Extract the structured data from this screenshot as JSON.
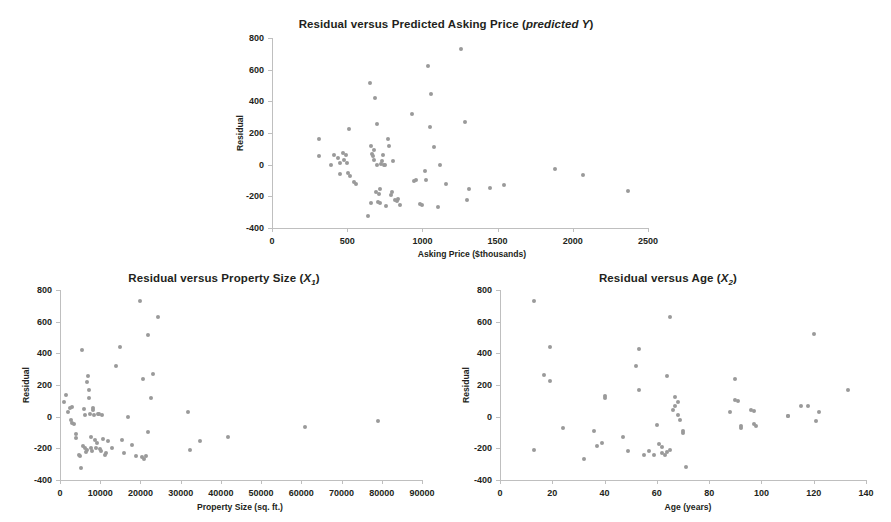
{
  "figure": {
    "background": "#ffffff",
    "point_color": "#9a9a9a",
    "axis_color": "#bfbfbf",
    "text_color": "#231f20"
  },
  "charts": {
    "top": {
      "title_prefix": "Residual versus Predicted Asking Price (",
      "title_italic": "predicted Y",
      "title_suffix": ")",
      "xlabel": "Asking Price ($thousands)",
      "ylabel": "Residual",
      "xticks": [
        "0",
        "500",
        "1000",
        "1500",
        "2000",
        "2500"
      ],
      "yticks": [
        "800",
        "600",
        "400",
        "200",
        "0",
        "-200",
        "-400"
      ]
    },
    "left": {
      "title_prefix": "Residual versus Property Size (",
      "title_var": "X",
      "title_sub": "1",
      "title_suffix": ")",
      "xlabel": "Property Size (sq. ft.)",
      "ylabel": "Residual",
      "xticks": [
        "0",
        "10000",
        "20000",
        "30000",
        "40000",
        "50000",
        "60000",
        "70000",
        "80000",
        "90000"
      ],
      "yticks": [
        "800",
        "600",
        "400",
        "200",
        "0",
        "-200",
        "-400"
      ]
    },
    "right": {
      "title_prefix": "Residual versus Age (",
      "title_var": "X",
      "title_sub": "2",
      "title_suffix": ")",
      "xlabel": "Age (years)",
      "ylabel": "Residual",
      "xticks": [
        "0",
        "20",
        "40",
        "60",
        "80",
        "100",
        "120",
        "140"
      ],
      "yticks": [
        "800",
        "600",
        "400",
        "200",
        "0",
        "-200",
        "-400"
      ]
    }
  },
  "chart_data": [
    {
      "id": "top",
      "type": "scatter",
      "title": "Residual versus Predicted Asking Price (predicted Y)",
      "xlabel": "Asking Price ($thousands)",
      "ylabel": "Residual",
      "xlim": [
        0,
        2500
      ],
      "ylim": [
        -400,
        800
      ],
      "xticks": [
        0,
        500,
        1000,
        1500,
        2000,
        2500
      ],
      "yticks": [
        -400,
        -200,
        0,
        200,
        400,
        600,
        800
      ],
      "grid": false,
      "legend": null,
      "points": [
        [
          310,
          160
        ],
        [
          315,
          55
        ],
        [
          390,
          0
        ],
        [
          415,
          60
        ],
        [
          440,
          45
        ],
        [
          450,
          10
        ],
        [
          455,
          -60
        ],
        [
          470,
          75
        ],
        [
          480,
          30
        ],
        [
          490,
          62
        ],
        [
          500,
          10
        ],
        [
          505,
          -55
        ],
        [
          515,
          225
        ],
        [
          520,
          -70
        ],
        [
          545,
          -110
        ],
        [
          560,
          -120
        ],
        [
          640,
          -325
        ],
        [
          650,
          515
        ],
        [
          655,
          -240
        ],
        [
          660,
          115
        ],
        [
          665,
          70
        ],
        [
          670,
          55
        ],
        [
          675,
          90
        ],
        [
          680,
          30
        ],
        [
          685,
          422
        ],
        [
          690,
          -170
        ],
        [
          695,
          0
        ],
        [
          700,
          255
        ],
        [
          705,
          -235
        ],
        [
          710,
          -185
        ],
        [
          715,
          -155
        ],
        [
          720,
          -245
        ],
        [
          725,
          5
        ],
        [
          730,
          25
        ],
        [
          740,
          60
        ],
        [
          745,
          0
        ],
        [
          750,
          -2
        ],
        [
          755,
          -260
        ],
        [
          770,
          165
        ],
        [
          780,
          120
        ],
        [
          790,
          -190
        ],
        [
          800,
          -175
        ],
        [
          805,
          25
        ],
        [
          820,
          -225
        ],
        [
          830,
          -230
        ],
        [
          840,
          -215
        ],
        [
          850,
          -255
        ],
        [
          930,
          320
        ],
        [
          945,
          -105
        ],
        [
          960,
          -95
        ],
        [
          985,
          -250
        ],
        [
          1000,
          -255
        ],
        [
          1015,
          -40
        ],
        [
          1025,
          -95
        ],
        [
          1040,
          625
        ],
        [
          1050,
          235
        ],
        [
          1060,
          445
        ],
        [
          1075,
          110
        ],
        [
          1105,
          -270
        ],
        [
          1120,
          0
        ],
        [
          1160,
          -120
        ],
        [
          1255,
          730
        ],
        [
          1280,
          270
        ],
        [
          1295,
          -220
        ],
        [
          1310,
          -155
        ],
        [
          1450,
          -150
        ],
        [
          1545,
          -130
        ],
        [
          1880,
          -28
        ],
        [
          2070,
          -68
        ],
        [
          2370,
          -165
        ]
      ]
    },
    {
      "id": "left",
      "type": "scatter",
      "title": "Residual versus Property Size (X1)",
      "xlabel": "Property Size (sq. ft.)",
      "ylabel": "Residual",
      "xlim": [
        0,
        90000
      ],
      "ylim": [
        -400,
        800
      ],
      "xticks": [
        0,
        10000,
        20000,
        30000,
        40000,
        50000,
        60000,
        70000,
        80000,
        90000
      ],
      "yticks": [
        -400,
        -200,
        0,
        200,
        400,
        600,
        800
      ],
      "grid": false,
      "legend": null,
      "points": [
        [
          900,
          95
        ],
        [
          1400,
          135
        ],
        [
          2000,
          30
        ],
        [
          2400,
          55
        ],
        [
          2700,
          -20
        ],
        [
          3000,
          -40
        ],
        [
          3100,
          60
        ],
        [
          3500,
          -45
        ],
        [
          3900,
          -110
        ],
        [
          4100,
          -135
        ],
        [
          4600,
          -240
        ],
        [
          4900,
          -250
        ],
        [
          5200,
          -325
        ],
        [
          5400,
          420
        ],
        [
          5600,
          -185
        ],
        [
          5900,
          50
        ],
        [
          6100,
          10
        ],
        [
          6200,
          -200
        ],
        [
          6400,
          -225
        ],
        [
          6600,
          -210
        ],
        [
          6800,
          220
        ],
        [
          7000,
          255
        ],
        [
          7100,
          168
        ],
        [
          7200,
          118
        ],
        [
          7400,
          15
        ],
        [
          7600,
          -130
        ],
        [
          7800,
          -195
        ],
        [
          7900,
          -215
        ],
        [
          8100,
          45
        ],
        [
          8300,
          55
        ],
        [
          8500,
          12
        ],
        [
          8700,
          -145
        ],
        [
          8900,
          -200
        ],
        [
          9200,
          -165
        ],
        [
          9500,
          15
        ],
        [
          9700,
          16
        ],
        [
          9900,
          -205
        ],
        [
          10200,
          -215
        ],
        [
          10500,
          12
        ],
        [
          10800,
          -140
        ],
        [
          11200,
          -240
        ],
        [
          11500,
          -230
        ],
        [
          12000,
          -155
        ],
        [
          13000,
          -195
        ],
        [
          14000,
          320
        ],
        [
          15000,
          443
        ],
        [
          15500,
          -150
        ],
        [
          16000,
          -230
        ],
        [
          17000,
          0
        ],
        [
          18000,
          -180
        ],
        [
          19000,
          -250
        ],
        [
          19800,
          730
        ],
        [
          20400,
          -255
        ],
        [
          20700,
          235
        ],
        [
          21000,
          -265
        ],
        [
          21300,
          -250
        ],
        [
          21800,
          513
        ],
        [
          22000,
          -95
        ],
        [
          22500,
          115
        ],
        [
          23200,
          270
        ],
        [
          24300,
          628
        ],
        [
          31800,
          30
        ],
        [
          32200,
          -210
        ],
        [
          34800,
          -155
        ],
        [
          41800,
          -128
        ],
        [
          61000,
          -65
        ],
        [
          79000,
          -25
        ]
      ]
    },
    {
      "id": "right",
      "type": "scatter",
      "title": "Residual versus Age (X2)",
      "xlabel": "Age (years)",
      "ylabel": "Residual",
      "xlim": [
        0,
        140
      ],
      "ylim": [
        -400,
        800
      ],
      "xticks": [
        0,
        20,
        40,
        60,
        80,
        100,
        120,
        140
      ],
      "yticks": [
        -400,
        -200,
        0,
        200,
        400,
        600,
        800
      ],
      "grid": false,
      "legend": null,
      "points": [
        [
          13,
          730
        ],
        [
          13,
          -208
        ],
        [
          17,
          265
        ],
        [
          19,
          443
        ],
        [
          19,
          228
        ],
        [
          24,
          -70
        ],
        [
          32,
          -265
        ],
        [
          36,
          -90
        ],
        [
          37,
          -185
        ],
        [
          39,
          -165
        ],
        [
          40,
          130
        ],
        [
          40,
          118
        ],
        [
          47,
          -130
        ],
        [
          49,
          -215
        ],
        [
          52,
          320
        ],
        [
          53,
          425
        ],
        [
          53,
          170
        ],
        [
          55,
          -240
        ],
        [
          57,
          -215
        ],
        [
          59,
          -245
        ],
        [
          60,
          -50
        ],
        [
          61,
          -175
        ],
        [
          62,
          -190
        ],
        [
          62,
          -230
        ],
        [
          63,
          -240
        ],
        [
          64,
          255
        ],
        [
          64,
          -225
        ],
        [
          65,
          630
        ],
        [
          65,
          -210
        ],
        [
          66,
          40
        ],
        [
          67,
          125
        ],
        [
          67,
          70
        ],
        [
          68,
          95
        ],
        [
          68,
          12
        ],
        [
          69,
          -20
        ],
        [
          70,
          -90
        ],
        [
          70,
          -105
        ],
        [
          71,
          -320
        ],
        [
          88,
          30
        ],
        [
          90,
          240
        ],
        [
          90,
          105
        ],
        [
          91,
          98
        ],
        [
          92,
          -60
        ],
        [
          92,
          -70
        ],
        [
          96,
          42
        ],
        [
          97,
          38
        ],
        [
          97,
          -45
        ],
        [
          98,
          -58
        ],
        [
          110,
          5
        ],
        [
          110,
          3
        ],
        [
          115,
          68
        ],
        [
          118,
          65
        ],
        [
          120,
          520
        ],
        [
          121,
          -25
        ],
        [
          122,
          32
        ],
        [
          133,
          170
        ]
      ]
    }
  ]
}
